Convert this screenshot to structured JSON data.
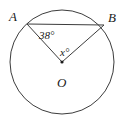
{
  "figure": {
    "type": "circle-geometry-diagram",
    "background_color": "#ffffff",
    "stroke_color": "#3c3c3c",
    "text_color": "#1a1a1a"
  },
  "labels": {
    "point_a": "A",
    "point_b": "B",
    "center_o": "O",
    "angle_at_a": "38°",
    "angle_at_o": "x°"
  },
  "geometry": {
    "circle": {
      "cx": 62,
      "cy": 62,
      "r": 52
    },
    "point_a": {
      "x": 27,
      "y": 24
    },
    "point_b": {
      "x": 104,
      "y": 25
    },
    "center": {
      "x": 62,
      "y": 62
    },
    "center_dot_r": 1.6,
    "chord": {
      "x1": 27,
      "y1": 24,
      "x2": 104,
      "y2": 25
    },
    "radius_oa": {
      "x1": 62,
      "y1": 62,
      "x2": 27,
      "y2": 24
    },
    "radius_ob": {
      "x1": 62,
      "y1": 62,
      "x2": 104,
      "y2": 25
    },
    "stroke_width": 1
  }
}
